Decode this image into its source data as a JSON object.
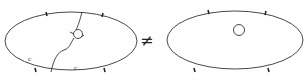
{
  "diagram": {
    "left": {
      "labels": {
        "c1": "c",
        "c2": "c"
      },
      "sub1": "1",
      "sub2": "1"
    },
    "relation": "≠",
    "stroke_color": "#333333"
  }
}
